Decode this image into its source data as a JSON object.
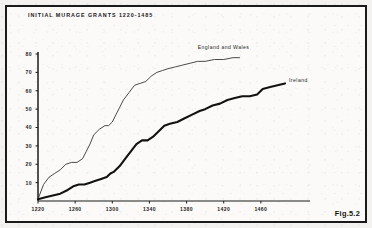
{
  "figure": {
    "title": "INITIAL MURAGE GRANTS 1220-1485",
    "caption": "Fig.5.2"
  },
  "chart_data": {
    "type": "line",
    "title": "INITIAL MURAGE GRANTS 1220-1485",
    "xlabel": "",
    "ylabel": "",
    "xlim": [
      1220,
      1500
    ],
    "ylim": [
      0,
      80
    ],
    "grid": false,
    "legend_position": "inline-end-of-line",
    "xticks": [
      1220,
      1260,
      1300,
      1340,
      1380,
      1420,
      1460
    ],
    "yticks": [
      10,
      20,
      30,
      40,
      50,
      60,
      70,
      80
    ],
    "annotations": [
      "England and Wales",
      "Ireland"
    ],
    "series": [
      {
        "name": "England and Wales",
        "style": "thin",
        "color": "#2b2b2b",
        "x": [
          1220,
          1226,
          1232,
          1238,
          1244,
          1250,
          1256,
          1262,
          1268,
          1272,
          1276,
          1280,
          1286,
          1292,
          1296,
          1300,
          1304,
          1308,
          1312,
          1318,
          1324,
          1330,
          1336,
          1342,
          1348,
          1354,
          1360,
          1368,
          1376,
          1384,
          1392,
          1400,
          1410,
          1420,
          1430,
          1437
        ],
        "y": [
          1,
          9,
          13,
          15,
          17,
          20,
          21,
          21,
          23,
          27,
          31,
          36,
          39,
          41,
          41,
          43,
          47,
          51,
          55,
          59,
          63,
          64,
          65,
          68,
          70,
          71,
          72,
          73,
          74,
          75,
          76,
          76,
          77,
          77,
          78,
          78
        ]
      },
      {
        "name": "Ireland",
        "style": "thick",
        "color": "#121212",
        "x": [
          1220,
          1228,
          1236,
          1244,
          1252,
          1258,
          1264,
          1270,
          1276,
          1282,
          1288,
          1294,
          1298,
          1302,
          1308,
          1314,
          1320,
          1326,
          1332,
          1338,
          1344,
          1350,
          1356,
          1362,
          1370,
          1378,
          1386,
          1394,
          1400,
          1408,
          1416,
          1424,
          1432,
          1440,
          1448,
          1456,
          1462,
          1470,
          1478,
          1486
        ],
        "y": [
          1,
          2,
          3,
          4,
          6,
          8,
          9,
          9,
          10,
          11,
          12,
          13,
          15,
          16,
          19,
          23,
          27,
          31,
          33,
          33,
          35,
          38,
          41,
          42,
          43,
          45,
          47,
          49,
          50,
          52,
          53,
          55,
          56,
          57,
          57,
          58,
          61,
          62,
          63,
          64
        ]
      }
    ]
  },
  "axis": {
    "x_labels": [
      "1220",
      "1260",
      "1300",
      "1340",
      "1380",
      "1420",
      "1460"
    ],
    "y_labels": [
      "80",
      "70",
      "60",
      "50",
      "40",
      "30",
      "20",
      "10"
    ]
  },
  "labels": {
    "england_and_wales": "England and Wales",
    "ireland": "Ireland"
  }
}
